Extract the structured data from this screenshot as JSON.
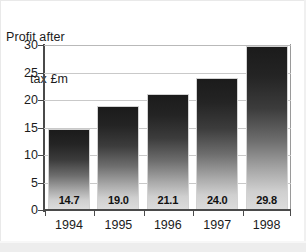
{
  "chart_data": {
    "type": "bar",
    "title": "Profit after tax £m",
    "title_line1": "Profit after",
    "title_line2": "tax £m",
    "xlabel": "",
    "ylabel": "",
    "categories": [
      "1994",
      "1995",
      "1996",
      "1997",
      "1998"
    ],
    "values": [
      14.7,
      19.0,
      21.1,
      24.0,
      29.8
    ],
    "value_labels": [
      "14.7",
      "19.0",
      "21.1",
      "24.0",
      "29.8"
    ],
    "ylim": [
      0,
      30
    ],
    "ytick_values": [
      0,
      5,
      10,
      15,
      20,
      25,
      30
    ],
    "ytick_labels": [
      "0",
      "5",
      "10",
      "15",
      "20",
      "25",
      "30"
    ],
    "grid": "horizontal",
    "legend": "none",
    "bar_style": {
      "gradient_top": "#1b1b1b",
      "gradient_bottom": "#dcdcdc",
      "edge": "#d2d2d2"
    },
    "colors": {
      "background": "#ffffff",
      "axis": "#4a4a4a",
      "gridline": "#c9c9c9",
      "text": "#1c1c1c"
    }
  }
}
